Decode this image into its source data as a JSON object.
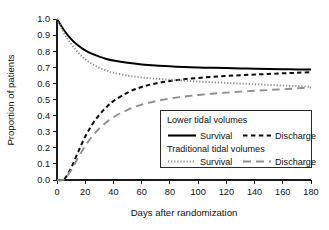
{
  "chart_data": {
    "type": "line",
    "title": "",
    "xlabel": "Days after randomization",
    "ylabel": "Proportion of patients",
    "xlim": [
      0,
      180
    ],
    "ylim": [
      0,
      1.0
    ],
    "xticks": [
      0,
      20,
      40,
      60,
      80,
      100,
      120,
      140,
      160,
      180
    ],
    "xtick_labels": [
      "0",
      "20",
      "40",
      "60",
      "80",
      "100",
      "120",
      "140",
      "160",
      "180"
    ],
    "yticks": [
      0.0,
      0.1,
      0.2,
      0.3,
      0.4,
      0.5,
      0.6,
      0.7,
      0.8,
      0.9,
      1.0
    ],
    "ytick_labels": [
      "0.0",
      "0.1",
      "0.2",
      "0.3",
      "0.4",
      "0.5",
      "0.6",
      "0.7",
      "0.8",
      "0.9",
      "1.0"
    ],
    "grid": false,
    "legend_position": "lower-right-inside",
    "x": [
      0,
      5,
      10,
      15,
      20,
      25,
      30,
      35,
      40,
      50,
      60,
      70,
      80,
      90,
      100,
      110,
      120,
      130,
      140,
      150,
      160,
      170,
      180
    ],
    "series": [
      {
        "name": "Lower tidal volumes — Survival",
        "group": "Lower tidal volumes",
        "outcome": "Survival",
        "style": "solid",
        "color": "#000000",
        "width": 2.0,
        "values": [
          1.0,
          0.93,
          0.875,
          0.835,
          0.805,
          0.783,
          0.766,
          0.752,
          0.742,
          0.728,
          0.718,
          0.711,
          0.706,
          0.702,
          0.699,
          0.697,
          0.695,
          0.693,
          0.691,
          0.69,
          0.688,
          0.687,
          0.686
        ]
      },
      {
        "name": "Lower tidal volumes — Discharge",
        "group": "Lower tidal volumes",
        "outcome": "Discharge",
        "style": "dashed",
        "color": "#0d0d0d",
        "width": 2.0,
        "values": [
          0.0,
          0.005,
          0.075,
          0.175,
          0.27,
          0.345,
          0.405,
          0.452,
          0.49,
          0.543,
          0.578,
          0.6,
          0.615,
          0.626,
          0.634,
          0.64,
          0.646,
          0.651,
          0.655,
          0.659,
          0.663,
          0.666,
          0.67
        ]
      },
      {
        "name": "Traditional tidal volumes — Survival",
        "group": "Traditional tidal volumes",
        "outcome": "Survival",
        "style": "dotted",
        "color": "#8c8c8c",
        "width": 1.9,
        "values": [
          1.0,
          0.912,
          0.845,
          0.792,
          0.75,
          0.72,
          0.697,
          0.68,
          0.666,
          0.648,
          0.637,
          0.629,
          0.623,
          0.617,
          0.612,
          0.607,
          0.603,
          0.599,
          0.595,
          0.591,
          0.587,
          0.583,
          0.578
        ]
      },
      {
        "name": "Traditional tidal volumes — Discharge",
        "group": "Traditional tidal volumes",
        "outcome": "Discharge",
        "style": "longdash",
        "color": "#8f8f8f",
        "width": 1.9,
        "values": [
          0.0,
          0.004,
          0.06,
          0.138,
          0.212,
          0.272,
          0.32,
          0.358,
          0.39,
          0.436,
          0.468,
          0.49,
          0.506,
          0.518,
          0.528,
          0.536,
          0.543,
          0.549,
          0.554,
          0.559,
          0.564,
          0.569,
          0.575
        ]
      }
    ]
  },
  "legend": {
    "group1_heading": "Lower tidal volumes",
    "group1_item1": "Survival",
    "group1_item2": "Discharge",
    "group2_heading": "Traditional tidal volumes",
    "group2_item1": "Survival",
    "group2_item2": "Discharge"
  },
  "colors": {
    "axis": "#1a1a1a",
    "text": "#111111",
    "black_series": "#000000",
    "gray_series": "#8c8c8c",
    "legend_border": "#2b2b2b",
    "background": "#ffffff"
  }
}
